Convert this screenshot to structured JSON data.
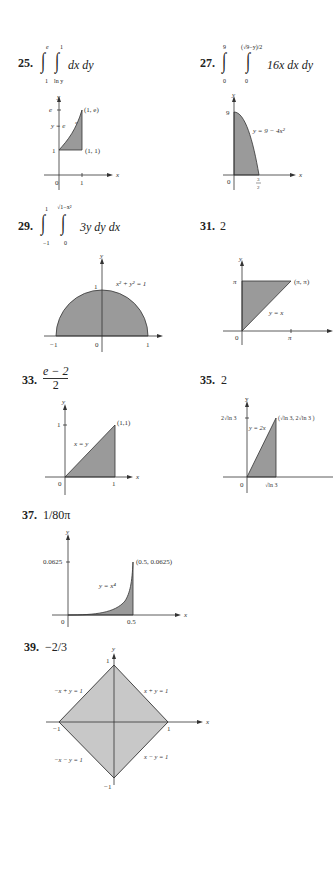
{
  "problems": [
    {
      "number": "25.",
      "answer": {
        "outer_upper": "e",
        "outer_lower": "1",
        "inner_upper": "1",
        "inner_lower": "ln y",
        "integrand": "dx dy"
      },
      "graph": {
        "y_label": "y",
        "x_label": "x",
        "curve_label": "y = e^x",
        "curve_base": "y = e",
        "curve_exp": "x",
        "points": [
          "(1, e)",
          "(1, 1)"
        ],
        "y_ticks": [
          "e",
          "1"
        ],
        "x_ticks": [
          "0",
          "1"
        ]
      }
    },
    {
      "number": "27.",
      "answer": {
        "outer_upper": "9",
        "outer_lower": "0",
        "inner_upper": "(√9−y)/2",
        "inner_lower": "0",
        "integrand": "16x dx dy"
      },
      "graph": {
        "y_label": "y",
        "x_label": "x",
        "curve_label": "y = 9 − 4x²",
        "y_ticks": [
          "9"
        ],
        "x_ticks": [
          "0",
          "3/2"
        ]
      }
    },
    {
      "number": "29.",
      "answer": {
        "outer_upper": "1",
        "outer_lower": "−1",
        "inner_upper": "√1−x²",
        "inner_lower": "0",
        "integrand": "3y dy dx"
      },
      "graph": {
        "y_label": "y",
        "x_label": "x",
        "curve_label": "x² + y² = 1",
        "y_ticks": [
          "1"
        ],
        "x_ticks": [
          "−1",
          "0",
          "1"
        ]
      }
    },
    {
      "number": "31.",
      "answer": {
        "value": "2"
      },
      "graph": {
        "y_label": "y",
        "x_label": "x",
        "curve_label": "y = x",
        "points": [
          "(π, π)"
        ],
        "y_ticks": [
          "π"
        ],
        "x_ticks": [
          "0",
          "π"
        ]
      }
    },
    {
      "number": "33.",
      "answer": {
        "numerator": "e − 2",
        "denominator": "2"
      },
      "graph": {
        "y_label": "y",
        "x_label": "x",
        "curve_label": "x = y",
        "points": [
          "(1,1)"
        ],
        "y_ticks": [
          "1"
        ],
        "x_ticks": [
          "0",
          "1"
        ]
      }
    },
    {
      "number": "35.",
      "answer": {
        "value": "2"
      },
      "graph": {
        "y_label": "y",
        "x_label": "x",
        "curve_label": "y = 2x",
        "points": [
          "(√ln 3, 2√ln 3 )"
        ],
        "y_ticks": [
          "2√ln 3"
        ],
        "x_ticks": [
          "0",
          "√ln 3"
        ]
      }
    },
    {
      "number": "37.",
      "answer": {
        "value": "1/80π"
      },
      "graph": {
        "y_label": "y",
        "x_label": "x",
        "curve_label": "y = x⁴",
        "points": [
          "(0.5, 0.0625)"
        ],
        "y_ticks": [
          "0.0625"
        ],
        "x_ticks": [
          "0",
          "0.5"
        ]
      }
    },
    {
      "number": "39.",
      "answer": {
        "value": "−2/3"
      },
      "graph": {
        "y_label": "y",
        "x_label": "x",
        "edge_labels": [
          "−x + y = 1",
          "x + y = 1",
          "−x − y = 1",
          "x − y = 1"
        ],
        "y_ticks": [
          "1",
          "−1"
        ],
        "x_ticks": [
          "−1",
          "1"
        ]
      }
    }
  ],
  "colors": {
    "fill_dark": "#9a9a9a",
    "fill_light": "#c8c8c8",
    "line": "#333333"
  }
}
